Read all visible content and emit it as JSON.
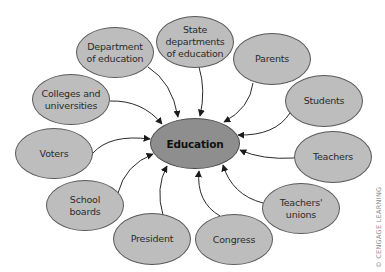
{
  "diagram": {
    "type": "hub-and-spoke",
    "center": {
      "label": "Education",
      "fill": "#8e8e8e"
    },
    "nodes": [
      {
        "id": "dept",
        "label": "Department\nof education"
      },
      {
        "id": "state",
        "label": "State\ndepartments\nof education"
      },
      {
        "id": "parents",
        "label": "Parents"
      },
      {
        "id": "students",
        "label": "Students"
      },
      {
        "id": "teachers",
        "label": "Teachers"
      },
      {
        "id": "unions",
        "label": "Teachers'\nunions"
      },
      {
        "id": "congress",
        "label": "Congress"
      },
      {
        "id": "president",
        "label": "President"
      },
      {
        "id": "boards",
        "label": "School\nboards"
      },
      {
        "id": "voters",
        "label": "Voters"
      },
      {
        "id": "colleges",
        "label": "Colleges and\nuniversities"
      }
    ],
    "edges_direction": "all outer nodes point to center",
    "node_fill": "#bdbdbd",
    "border_color": "#5a5a5a"
  },
  "watermark": "© CENGAGE LEARNING"
}
